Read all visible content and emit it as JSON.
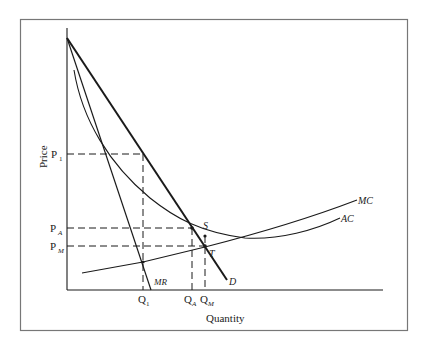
{
  "diagram": {
    "axes": {
      "y_label": "Price",
      "x_label": "Quantity"
    },
    "price_levels": [
      {
        "id": "P1",
        "label": "P",
        "sub": "1"
      },
      {
        "id": "PA",
        "label": "P",
        "sub": "A"
      },
      {
        "id": "PM",
        "label": "P",
        "sub": "M"
      }
    ],
    "quantity_levels": [
      {
        "id": "Q1",
        "label": "Q",
        "sub": "1"
      },
      {
        "id": "QA",
        "label": "Q",
        "sub": "A"
      },
      {
        "id": "QM",
        "label": "Q",
        "sub": "M"
      }
    ],
    "curves": {
      "demand": "D",
      "marginal_revenue": "MR",
      "marginal_cost": "MC",
      "average_cost": "AC"
    },
    "points": {
      "s": "S",
      "t": "T"
    },
    "colors": {
      "line": "#1a1a1a",
      "frame": "#777777",
      "background": "#ffffff"
    }
  }
}
